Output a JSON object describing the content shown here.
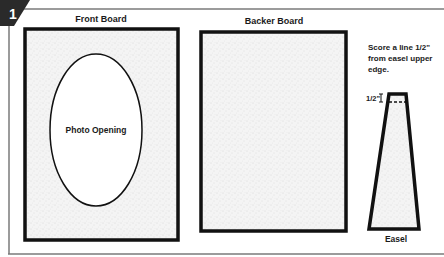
{
  "step": {
    "number": "1"
  },
  "front_board": {
    "title": "Front Board",
    "opening_label": "Photo Opening"
  },
  "backer_board": {
    "title": "Backer Board"
  },
  "easel": {
    "instruction_lines": [
      "Score a line 1/2\"",
      "from easel upper",
      "edge."
    ],
    "measure_label": "1/2\"",
    "title": "Easel"
  },
  "colors": {
    "line": "#111111",
    "panel_border": "#6a6a6a",
    "texture_bg": "#f3f3f3",
    "step_badge": "#2a2a2a"
  }
}
